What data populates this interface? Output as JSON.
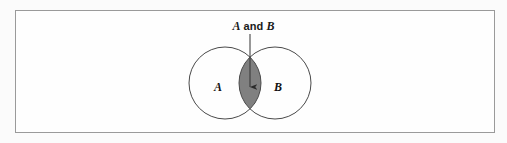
{
  "figure": {
    "type": "venn-diagram",
    "frame": {
      "border_color": "#9a9a9a",
      "fill_color": "#fefefe",
      "x": 15,
      "y": 10,
      "width": 480,
      "height": 123
    },
    "caption": {
      "full_text": "A and B",
      "parts": {
        "left_set": "A",
        "conjunction": "and",
        "right_set": "B"
      },
      "points_to": "intersection"
    },
    "annotation_arrow": {
      "name": "intersection-pointer",
      "from_y": 34,
      "to_y": 87,
      "x": 250,
      "color": "#333333"
    },
    "sets": [
      {
        "label": "A",
        "cx": 225,
        "cy": 83,
        "r": 36,
        "stroke": "#4a4a4a",
        "fill": "#ffffff",
        "label_x": 218,
        "label_y": 88
      },
      {
        "label": "B",
        "cx": 275,
        "cy": 83,
        "r": 36,
        "stroke": "#4a4a4a",
        "fill": "#ffffff",
        "label_x": 278,
        "label_y": 88
      }
    ],
    "intersection": {
      "name": "A and B",
      "shaded": true,
      "fill_color": "#808080",
      "stroke_color": "#3a3a3a"
    }
  }
}
